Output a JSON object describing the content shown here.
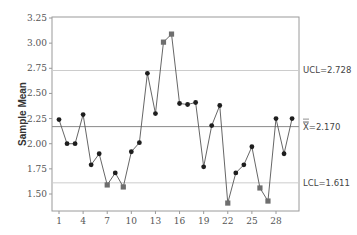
{
  "chart_data": {
    "type": "line",
    "subtype": "xbar-control-chart",
    "title": "",
    "xlabel": "",
    "ylabel": "Sample Mean",
    "x": [
      1,
      2,
      3,
      4,
      5,
      6,
      7,
      8,
      9,
      10,
      11,
      12,
      13,
      14,
      15,
      16,
      17,
      18,
      19,
      20,
      21,
      22,
      23,
      24,
      25,
      26,
      27,
      28,
      29,
      30
    ],
    "values": [
      2.24,
      2.0,
      2.0,
      2.29,
      1.79,
      1.9,
      1.59,
      1.71,
      1.57,
      1.92,
      2.01,
      2.7,
      2.3,
      3.01,
      3.09,
      2.4,
      2.39,
      2.41,
      1.77,
      2.18,
      2.38,
      1.41,
      1.71,
      1.79,
      1.97,
      1.56,
      1.43,
      2.25,
      1.9,
      2.25
    ],
    "out_of_control": [
      7,
      9,
      14,
      15,
      22,
      26,
      27
    ],
    "xticks": [
      1,
      4,
      7,
      10,
      13,
      16,
      19,
      22,
      25,
      28
    ],
    "yticks": [
      1.5,
      1.75,
      2.0,
      2.25,
      2.5,
      2.75,
      3.0,
      3.25
    ],
    "ytick_labels": [
      "1.50",
      "1.75",
      "2.00",
      "2.25",
      "2.50",
      "2.75",
      "3.00",
      "3.25"
    ],
    "ylim": [
      1.345,
      3.26
    ],
    "xlim": [
      0.3,
      30.8
    ],
    "control_limits": {
      "ucl": 2.728,
      "center": 2.17,
      "lcl": 1.611
    },
    "annotations": {
      "ucl_label": "UCL=2.728",
      "center_label": "=2.170",
      "center_symbol": "X",
      "lcl_label": "LCL=1.611"
    },
    "grid": false,
    "legend": null
  },
  "colors": {
    "series_line": "#555555",
    "point": "#1e1e1e",
    "out_of_control_point": "#6e6e6e",
    "center_line": "#8a8a8a",
    "limit_line": "#cccccc",
    "frame": "#9a9a9a"
  }
}
